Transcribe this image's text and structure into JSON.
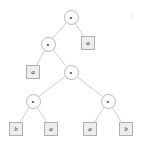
{
  "diagram": {
    "kind": "tree",
    "canvas": {
      "width": 143,
      "height": 144,
      "background": "#ffffff"
    },
    "style": {
      "internal_node_shape": "circle",
      "internal_node_fill": "#fdfdfd",
      "internal_node_stroke": "#b8b8b8",
      "leaf_node_shape": "square",
      "leaf_node_fill": "#ededed",
      "leaf_node_stroke": "#b0b0b0",
      "edge_color": "#c9c9c9"
    },
    "nodes": [
      {
        "id": "n0",
        "shape": "circle",
        "label": "∘",
        "x": 71,
        "y": 17
      },
      {
        "id": "n1",
        "shape": "circle",
        "label": "∘",
        "x": 48,
        "y": 44
      },
      {
        "id": "l1",
        "shape": "square",
        "label": "a",
        "x": 88,
        "y": 43
      },
      {
        "id": "l2",
        "shape": "square",
        "label": "a",
        "x": 33,
        "y": 72
      },
      {
        "id": "n2",
        "shape": "circle",
        "label": "∘",
        "x": 71,
        "y": 72
      },
      {
        "id": "n3",
        "shape": "circle",
        "label": "∘",
        "x": 33,
        "y": 101
      },
      {
        "id": "n4",
        "shape": "circle",
        "label": "∘",
        "x": 108,
        "y": 101
      },
      {
        "id": "l3",
        "shape": "square",
        "label": "b",
        "x": 16,
        "y": 129
      },
      {
        "id": "l4",
        "shape": "square",
        "label": "a",
        "x": 51,
        "y": 129
      },
      {
        "id": "l5",
        "shape": "square",
        "label": "a",
        "x": 90,
        "y": 129
      },
      {
        "id": "l6",
        "shape": "square",
        "label": "b",
        "x": 126,
        "y": 129
      }
    ],
    "edges": [
      {
        "from": "n0",
        "to": "n1"
      },
      {
        "from": "n0",
        "to": "l1"
      },
      {
        "from": "n1",
        "to": "l2"
      },
      {
        "from": "n1",
        "to": "n2"
      },
      {
        "from": "n2",
        "to": "n3"
      },
      {
        "from": "n2",
        "to": "n4"
      },
      {
        "from": "n3",
        "to": "l3"
      },
      {
        "from": "n3",
        "to": "l4"
      },
      {
        "from": "n4",
        "to": "l5"
      },
      {
        "from": "n4",
        "to": "l6"
      }
    ],
    "leaf_sequence": [
      "b",
      "a",
      "a",
      "b",
      "a"
    ],
    "artifacts": [
      {
        "id": "speck1",
        "x": 131,
        "y": 15
      }
    ]
  }
}
